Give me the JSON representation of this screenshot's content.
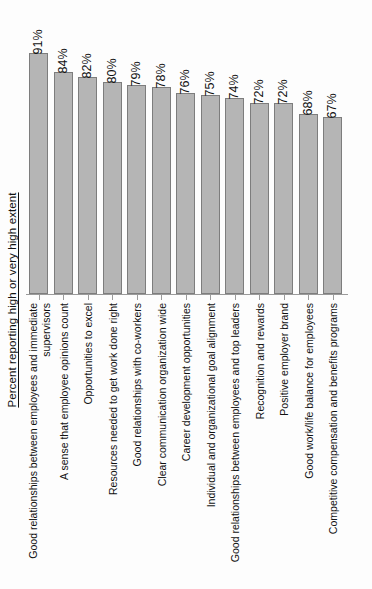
{
  "chart_data": {
    "type": "bar",
    "title": "",
    "subtitle": "",
    "xlabel": "",
    "ylabel": "Percent reporting high or very high extent",
    "ylim": [
      0,
      100
    ],
    "grid": false,
    "legend": "none",
    "orientation": "vertical",
    "value_suffix": "%",
    "categories": [
      "Good relationships between employees and immediate supervisors",
      "A sense that employee opinions count",
      "Opportunities to excel",
      "Resources needed to get work done right",
      "Good relationships with co-workers",
      "Clear communication organization wide",
      "Career development opportunities",
      "Individual and organizational goal alignment",
      "Good relationships between employees and  top leaders",
      "Recognition and rewards",
      "Positive employer brand",
      "Good work/life balance for employees",
      "Competitive compensation and benefits programs"
    ],
    "category_lines": [
      [
        "Good relationships between employees and immediate",
        "supervisors"
      ],
      [
        "A sense that employee opinions count"
      ],
      [
        "Opportunities to excel"
      ],
      [
        "Resources needed to get work done right"
      ],
      [
        "Good relationships with co-workers"
      ],
      [
        "Clear communication organization wide"
      ],
      [
        "Career development opportunities"
      ],
      [
        "Individual and organizational goal alignment"
      ],
      [
        "Good relationships between employees and  top leaders"
      ],
      [
        "Recognition and rewards"
      ],
      [
        "Positive employer brand"
      ],
      [
        "Good work/life balance for employees"
      ],
      [
        "Competitive compensation and benefits programs"
      ]
    ],
    "values": [
      91,
      84,
      82,
      80,
      79,
      78,
      76,
      75,
      74,
      72,
      72,
      68,
      67
    ],
    "value_labels": [
      "91%",
      "84%",
      "82%",
      "80%",
      "79%",
      "78%",
      "76%",
      "75%",
      "74%",
      "72%",
      "72%",
      "68%",
      "67%"
    ],
    "colors": {
      "bar_fill": "#b5b5b5",
      "bar_border": "#7d7d7d",
      "axis": "#9a9a9a",
      "text": "#111111",
      "background": "#fdfdfd"
    }
  }
}
